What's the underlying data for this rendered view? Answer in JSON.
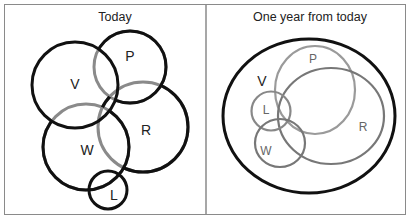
{
  "panels": [
    {
      "title": "Today",
      "sets": {
        "V": {
          "label": "V",
          "color": "#111111"
        },
        "P": {
          "label": "P",
          "color": "#111111"
        },
        "R": {
          "label": "R",
          "color": "#111111"
        },
        "W": {
          "label": "W",
          "color": "#111111"
        },
        "L": {
          "label": "L",
          "color": "#111111"
        }
      }
    },
    {
      "title": "One year from today",
      "sets": {
        "V": {
          "label": "V",
          "color": "#111111"
        },
        "P": {
          "label": "P",
          "color": "#999999"
        },
        "R": {
          "label": "R",
          "color": "#777777"
        },
        "W": {
          "label": "W",
          "color": "#777777"
        },
        "L": {
          "label": "L",
          "color": "#888888"
        }
      }
    }
  ],
  "colors": {
    "frame": "#8a8a8a",
    "overlap_stroke": "#8a8a8a"
  }
}
